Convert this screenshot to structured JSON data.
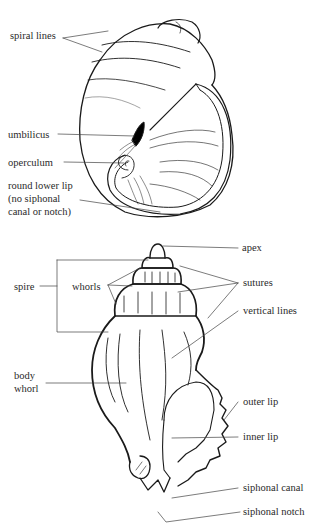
{
  "figure_1": {
    "title": "Snail shell (umbilicate, round aperture)",
    "labels": {
      "spiral_lines": "spiral lines",
      "umbilicus": "umbilicus",
      "operculum": "operculum",
      "round_lower_lip_l1": "round lower lip",
      "round_lower_lip_l2": "(no siphonal",
      "round_lower_lip_l3": "canal or notch)"
    }
  },
  "figure_2": {
    "title": "Whelk shell (siphonal canal)",
    "labels": {
      "apex": "apex",
      "spire": "spire",
      "whorls": "whorls",
      "sutures": "sutures",
      "vertical_lines": "vertical  lines",
      "body_whorl_l1": "body",
      "body_whorl_l2": "whorl",
      "outer_lip": "outer lip",
      "inner_lip": "inner lip",
      "siphonal_canal": "siphonal canal",
      "siphonal_notch": "siphonal notch"
    }
  }
}
